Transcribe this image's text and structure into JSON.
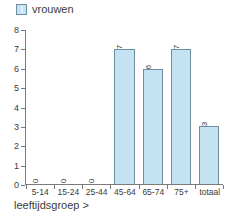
{
  "legend": {
    "entries": [
      {
        "label": "vrouwen",
        "color": "#c5e2f2",
        "border": "#6d8fa3"
      }
    ]
  },
  "axis": {
    "x_title": "leeftijdsgroep >",
    "y_ticks": [
      "0",
      "1",
      "2",
      "3",
      "4",
      "5",
      "6",
      "7",
      "8"
    ]
  },
  "chart_data": {
    "type": "bar",
    "title": "",
    "subtitle": "",
    "xlabel": "leeftijdsgroep >",
    "ylabel": "",
    "categories": [
      "5-14",
      "15-24",
      "25-44",
      "45-64",
      "65-74",
      "75+",
      "totaal"
    ],
    "series": [
      {
        "name": "vrouwen",
        "values": [
          0,
          0,
          0,
          7,
          6,
          7,
          3
        ],
        "color": "#c5e2f2",
        "border_color": "#6d8fa3"
      }
    ],
    "value_labels": [
      "0",
      "0",
      "0",
      "7",
      "6",
      "7",
      "3"
    ],
    "value_label_rotation": -90,
    "ylim": [
      0,
      8
    ],
    "ytick_step": 1,
    "grid": false,
    "legend_position": "top-left",
    "axis_color": "#7a7a7a",
    "text_color": "#3b3b3b",
    "background": "#ffffff"
  }
}
